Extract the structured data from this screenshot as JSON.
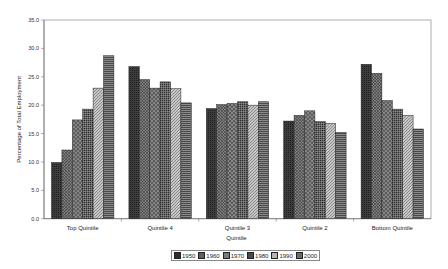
{
  "chart_data": {
    "type": "bar",
    "title": "",
    "xlabel": "Quintile",
    "ylabel": "Percentage of Total Employment",
    "ylim": [
      0,
      35
    ],
    "yticks": [
      "0.0",
      "5.0",
      "10.0",
      "15.0",
      "20.0",
      "25.0",
      "30.0",
      "35.0"
    ],
    "grid": false,
    "legend_position": "bottom",
    "categories": [
      "Top Quintile",
      "Quintile 4",
      "Quintile 3",
      "Quintile 2",
      "Bottom Quintile"
    ],
    "series": [
      {
        "name": "1950",
        "values": [
          9.9,
          26.8,
          19.4,
          17.2,
          27.2
        ],
        "color": "#3c3c3c"
      },
      {
        "name": "1960",
        "values": [
          12.1,
          24.5,
          20.1,
          18.2,
          25.6
        ],
        "color": "#6a6a6a"
      },
      {
        "name": "1970",
        "values": [
          17.4,
          23.0,
          20.3,
          19.0,
          20.8
        ],
        "color": "#7a7a7a"
      },
      {
        "name": "1980",
        "values": [
          19.3,
          24.1,
          20.6,
          17.1,
          19.3
        ],
        "color": "#585858"
      },
      {
        "name": "1990",
        "values": [
          23.0,
          22.9,
          20.0,
          16.8,
          18.2
        ],
        "color": "#ababab"
      },
      {
        "name": "2000",
        "values": [
          28.7,
          20.4,
          20.6,
          15.2,
          15.8
        ],
        "color": "#6e6e6e"
      }
    ]
  }
}
